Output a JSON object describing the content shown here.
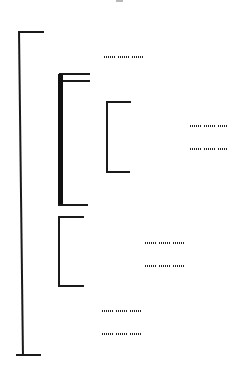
{
  "diagram": {
    "type": "bracket-tree / dendrogram",
    "line_color": "#1a1a1a",
    "background": "#ffffff",
    "labels": [
      {
        "id": "label-1",
        "text": "[illegible] [illegible] [illegible]",
        "words": 3
      },
      {
        "id": "label-2",
        "text": "[illegible] [illegible] [illegible]",
        "words": 3
      },
      {
        "id": "label-3",
        "text": "[illegible] [illegible] [illegible]",
        "words": 3
      },
      {
        "id": "label-4",
        "text": "[illegible] [illegible] [illegible]",
        "words": 3
      },
      {
        "id": "label-5",
        "text": "[illegible] [illegible] [illegible]",
        "words": 3
      },
      {
        "id": "label-6",
        "text": "[illegible] [illegible] [illegible]",
        "words": 3
      },
      {
        "id": "label-7",
        "text": "[illegible] [illegible] [illegible]",
        "words": 3
      }
    ],
    "brackets": [
      {
        "id": "outer-bracket",
        "children": [
          "label-1",
          "thick-bracket",
          "lower-bracket",
          "label-6",
          "label-7"
        ]
      },
      {
        "id": "thick-bracket",
        "children": [
          "inner-bracket"
        ]
      },
      {
        "id": "inner-bracket",
        "children": [
          "label-2",
          "label-3"
        ]
      },
      {
        "id": "lower-bracket",
        "children": [
          "label-4",
          "label-5"
        ]
      }
    ]
  }
}
